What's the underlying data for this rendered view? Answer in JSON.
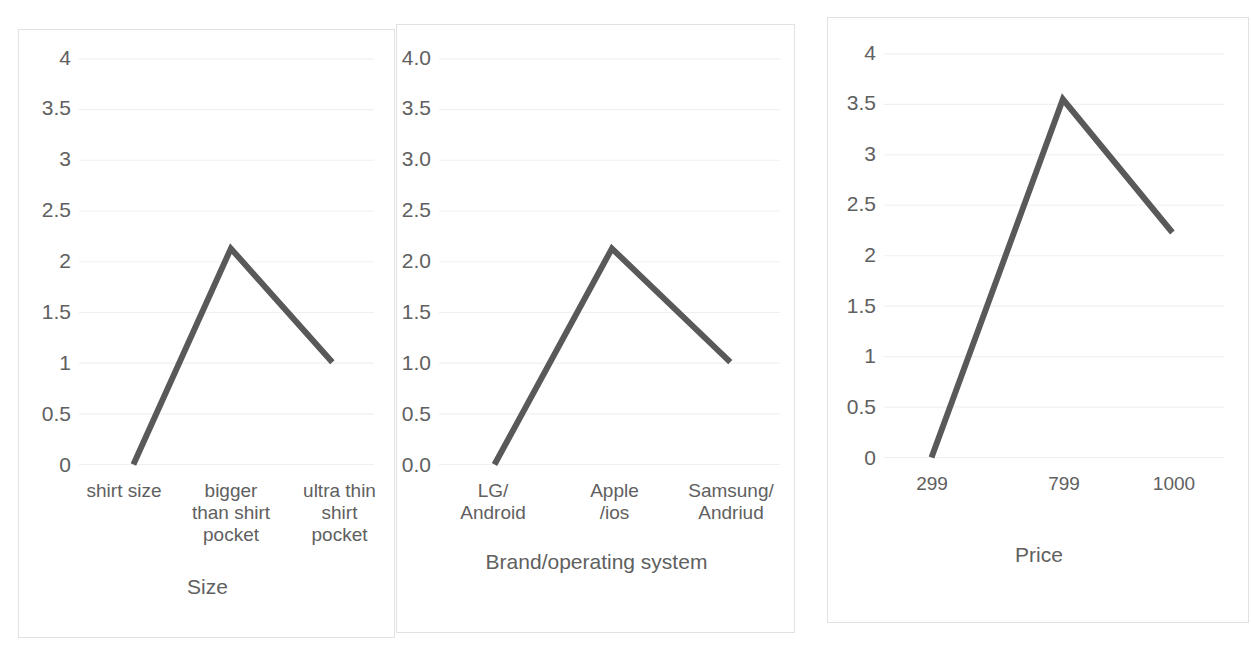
{
  "page": {
    "background_color": "#ffffff",
    "panel_border_color": "#e2e2e2",
    "gridline_color": "#f0f0f0",
    "text_color": "#606060",
    "line_color": "#595959"
  },
  "chart_data": [
    {
      "id": "size-chart",
      "type": "line",
      "title": "",
      "xlabel": "Size",
      "ylabel": "",
      "categories": [
        "shirt size",
        "bigger than shirt pocket",
        "ultra thin shirt pocket"
      ],
      "category_lines": [
        [
          "shirt size"
        ],
        [
          "bigger",
          "than shirt",
          "pocket"
        ],
        [
          "ultra thin",
          "shirt",
          "pocket"
        ]
      ],
      "values": [
        0,
        2.13,
        1.01
      ],
      "ylim": [
        0,
        4
      ],
      "yticks": [
        "0",
        "0.5",
        "1",
        "1.5",
        "2",
        "2.5",
        "3",
        "3.5",
        "4"
      ],
      "ytick_values": [
        0,
        0.5,
        1,
        1.5,
        2,
        2.5,
        3,
        3.5,
        4
      ],
      "grid": true,
      "legend": "none",
      "series_color": "#595959"
    },
    {
      "id": "brand-os-chart",
      "type": "line",
      "title": "",
      "xlabel": "Brand/operating system",
      "ylabel": "",
      "categories": [
        "LG/ Android",
        "Apple /ios",
        "Samsung/ Andriud"
      ],
      "category_lines": [
        [
          "LG/",
          "Android"
        ],
        [
          "Apple",
          "/ios"
        ],
        [
          "Samsung/",
          "Andriud"
        ]
      ],
      "values": [
        0.0,
        2.13,
        1.01
      ],
      "ylim": [
        0,
        4
      ],
      "yticks": [
        "0.0",
        "0.5",
        "1.0",
        "1.5",
        "2.0",
        "2.5",
        "3.0",
        "3.5",
        "4.0"
      ],
      "ytick_values": [
        0,
        0.5,
        1,
        1.5,
        2,
        2.5,
        3,
        3.5,
        4
      ],
      "grid": true,
      "legend": "none",
      "series_color": "#595959"
    },
    {
      "id": "price-chart",
      "type": "line",
      "title": "",
      "xlabel": "Price",
      "ylabel": "",
      "categories": [
        "299",
        "799",
        "1000"
      ],
      "category_lines": [
        [
          "299"
        ],
        [
          "799"
        ],
        [
          "1000"
        ]
      ],
      "values": [
        0,
        3.55,
        2.23
      ],
      "ylim": [
        0,
        4
      ],
      "yticks": [
        "0",
        "0.5",
        "1",
        "1.5",
        "2",
        "2.5",
        "3",
        "3.5",
        "4"
      ],
      "ytick_values": [
        0,
        0.5,
        1,
        1.5,
        2,
        2.5,
        3,
        3.5,
        4
      ],
      "grid": true,
      "legend": "none",
      "series_color": "#595959"
    }
  ]
}
